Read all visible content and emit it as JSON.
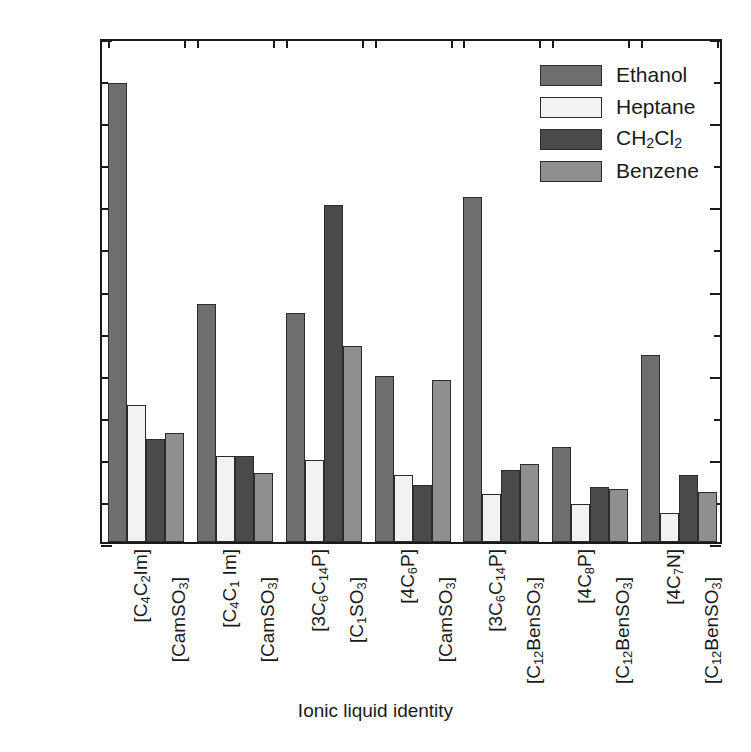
{
  "chart_data": {
    "type": "bar",
    "title": "",
    "xlabel": "Ionic liquid identity",
    "ylabel": "Δf (Hz/100 mg/L gas/µg IL)",
    "ylim": [
      0.0,
      2.4
    ],
    "ytick_labels": [
      "0.0",
      "0.4",
      "0.8",
      "1.2",
      "1.6",
      "2.0",
      "2.4"
    ],
    "ytick_values": [
      0.0,
      0.4,
      0.8,
      1.2,
      1.6,
      2.0,
      2.4
    ],
    "yminor_step": 0.2,
    "grid": false,
    "legend_position": "top-right",
    "legend": [
      "Ethanol",
      "Heptane",
      "CH₂Cl₂",
      "Benzene"
    ],
    "series_colors": [
      "#6e6e6e",
      "#f2f2f2",
      "#4a4a4a",
      "#8f8f8f"
    ],
    "categories": [
      "[C4C2Im][CamSO3]",
      "[C4C1Im][CamSO3]",
      "[3C6C14P][C1SO3]",
      "[4C6P][CamSO3]",
      "[3C6C14P][C12BenSO3]",
      "[4C8P][C12BenSO3]",
      "[4C7N][C12BenSO3]"
    ],
    "category_labels": [
      {
        "cation": "[C4C2Im]",
        "anion": "[CamSO3]"
      },
      {
        "cation": "[C4C1Im]",
        "anion": "[CamSO3]"
      },
      {
        "cation": "[3C6C14P]",
        "anion": "[C1SO3]"
      },
      {
        "cation": "[4C6P]",
        "anion": "[CamSO3]"
      },
      {
        "cation": "[3C6C14P]",
        "anion": "[C12BenSO3]"
      },
      {
        "cation": "[4C8P]",
        "anion": "[C12BenSO3]"
      },
      {
        "cation": "[4C7N]",
        "anion": "[C12BenSO3]"
      }
    ],
    "series": [
      {
        "name": "Ethanol",
        "values": [
          2.18,
          1.13,
          1.09,
          0.79,
          1.64,
          0.45,
          0.89
        ]
      },
      {
        "name": "Heptane",
        "values": [
          0.65,
          0.41,
          0.39,
          0.32,
          0.23,
          0.18,
          0.14
        ]
      },
      {
        "name": "CH2Cl2",
        "values": [
          0.49,
          0.41,
          1.6,
          0.27,
          0.34,
          0.26,
          0.32
        ]
      },
      {
        "name": "Benzene",
        "values": [
          0.52,
          0.33,
          0.93,
          0.77,
          0.37,
          0.25,
          0.24
        ]
      }
    ]
  },
  "legend_items": [
    {
      "label": "Ethanol",
      "html": "Ethanol",
      "color": "#6e6e6e"
    },
    {
      "label": "Heptane",
      "html": "Heptane",
      "color": "#f2f2f2"
    },
    {
      "label": "CH2Cl2",
      "html": "CH<sub>2</sub>Cl<sub>2</sub>",
      "color": "#4a4a4a"
    },
    {
      "label": "Benzene",
      "html": "Benzene",
      "color": "#8f8f8f"
    }
  ],
  "axis": {
    "y_title_html": "Δ<i>f</i> (Hz/100 mg/L gas/µg IL)",
    "x_title": "Ionic liquid identity"
  },
  "x_tick_labels_html": [
    "[C<sub>4</sub>C<sub>2</sub>Im]",
    "[CamSO<sub>3</sub>]",
    "[C<sub>4</sub>C<sub>1</sub> Im]",
    "[CamSO<sub>3</sub>]",
    "[3C<sub>6</sub>C<sub>14</sub>P]",
    "[C<sub>1</sub>SO<sub>3</sub>]",
    "[4C<sub>6</sub>P]",
    "[CamSO<sub>3</sub>]",
    "[3C<sub>6</sub>C<sub>14</sub>P]",
    "[C<sub>12</sub>BenSO<sub>3</sub>]",
    "[4C<sub>8</sub>P]",
    "[C<sub>12</sub>BenSO<sub>3</sub>]",
    "[4C<sub>7</sub>N]",
    "[C<sub>12</sub>BenSO<sub>3</sub>]"
  ]
}
